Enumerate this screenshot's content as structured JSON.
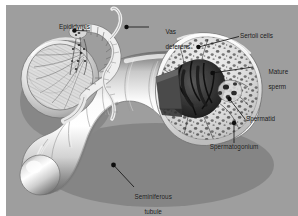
{
  "figure": {
    "background_color": "#9e9e9e",
    "page_color": "#ffffff",
    "ink_color": "#171717",
    "width": 298,
    "height": 216
  },
  "labels": {
    "epididymis": "Epididymis",
    "vas_deferens_line1": "Vas",
    "vas_deferens_line2": "deferens",
    "sertoli_cells": "Sertoli cells",
    "mature_sperm_line1": "Mature",
    "mature_sperm_line2": "sperm",
    "spermatid": "Spermatid",
    "spermatogonium": "Spermatogonium",
    "seminiferous_tubule_line1": "Seminiferous",
    "seminiferous_tubule_line2": "tubule"
  },
  "callouts": [
    {
      "name": "epididymis",
      "dot_x": 68,
      "dot_y": 25,
      "text_x": 52,
      "text_y": 22
    },
    {
      "name": "vas-deferens",
      "dot_x": 120,
      "dot_y": 22,
      "text_x": 146,
      "text_y": 19
    },
    {
      "name": "sertoli-cells",
      "dot_x": 192,
      "dot_y": 42,
      "text_x": 236,
      "text_y": 31
    },
    {
      "name": "mature-sperm",
      "dot_x": 206,
      "dot_y": 68,
      "text_x": 250,
      "text_y": 59
    },
    {
      "name": "spermatid",
      "dot_x": 223,
      "dot_y": 94,
      "text_x": 241,
      "text_y": 113
    },
    {
      "name": "spermatogonium",
      "dot_x": 228,
      "dot_y": 118,
      "text_x": 201,
      "text_y": 141
    },
    {
      "name": "seminiferous-tubule",
      "dot_x": 107,
      "dot_y": 160,
      "text_x": 124,
      "text_y": 183
    }
  ]
}
